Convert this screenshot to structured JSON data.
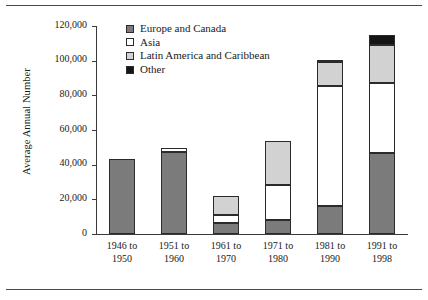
{
  "chart_data": {
    "type": "bar",
    "subtype": "stacked",
    "title": "",
    "xlabel": "",
    "ylabel": "Average Annual Number",
    "categories": [
      "1946 to 1950",
      "1951 to 1960",
      "1961 to 1970",
      "1971 to 1980",
      "1981 to 1990",
      "1991 to 1998"
    ],
    "series": [
      {
        "name": "Europe and Canada",
        "color": "#7b7b7b",
        "values": [
          43000,
          47500,
          6500,
          8000,
          16000,
          47000
        ]
      },
      {
        "name": "Asia",
        "color": "#ffffff",
        "values": [
          0,
          2000,
          4500,
          20500,
          69500,
          40000
        ]
      },
      {
        "name": "Latin America and Caribbean",
        "color": "#d2d2d2",
        "values": [
          0,
          0,
          11000,
          25000,
          13500,
          22000
        ]
      },
      {
        "name": "Other",
        "color": "#151515",
        "values": [
          0,
          0,
          0,
          0,
          1000,
          6000
        ]
      }
    ],
    "totals": [
      43000,
      49500,
      22000,
      53500,
      100000,
      115000
    ],
    "ylim": [
      0,
      120000
    ],
    "yticks": [
      0,
      20000,
      40000,
      60000,
      80000,
      100000,
      120000
    ],
    "ytick_labels": [
      "0",
      "20,000",
      "40,000",
      "60,000",
      "80,000",
      "100,000",
      "120,000"
    ],
    "grid": false,
    "legend_position": "top-center-inside"
  },
  "legend": {
    "items": [
      {
        "label": "Europe and Canada",
        "swatch": "#7b7b7b"
      },
      {
        "label": "Asia",
        "swatch": "#ffffff"
      },
      {
        "label": "Latin America and Caribbean",
        "swatch": "#d2d2d2"
      },
      {
        "label": "Other",
        "swatch": "#151515"
      }
    ]
  }
}
